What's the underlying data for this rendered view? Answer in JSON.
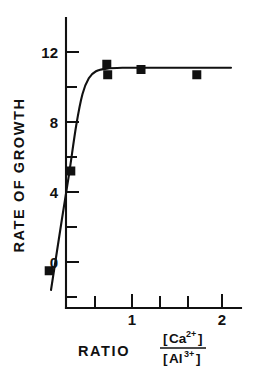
{
  "chart_data": {
    "type": "scatter",
    "title": "",
    "xlabel": "RATIO [Ca2+]/[Al3+]",
    "ylabel": "RATE OF GROWTH",
    "xlim": [
      0,
      2.2
    ],
    "ylim": [
      -2.5,
      13.5
    ],
    "grid": false,
    "legend": "none",
    "x_ticks": [
      0.5,
      1.0,
      1.5,
      2.0
    ],
    "x_tick_labels": [
      "",
      "1",
      "",
      "2"
    ],
    "x_minor_ticks": [
      0.75,
      1.25,
      1.75
    ],
    "y_ticks": [
      0,
      4,
      8,
      12
    ],
    "y_tick_labels": [
      "0",
      "4",
      "8",
      "12"
    ],
    "y_minor_ticks": [
      -2,
      2,
      6,
      10
    ],
    "points": [
      {
        "x": 0.08,
        "y": -0.5
      },
      {
        "x": 0.32,
        "y": 5.2
      },
      {
        "x": 0.72,
        "y": 11.3
      },
      {
        "x": 0.73,
        "y": 10.7
      },
      {
        "x": 1.1,
        "y": 11.0
      },
      {
        "x": 1.72,
        "y": 10.7
      }
    ],
    "curve_description": "sigmoidal saturation curve rising steeply from about 0 to a plateau of about 11",
    "curve": [
      {
        "x": 0.1,
        "y": -1.6
      },
      {
        "x": 0.22,
        "y": 2.4
      },
      {
        "x": 0.3,
        "y": 5.0
      },
      {
        "x": 0.38,
        "y": 7.8
      },
      {
        "x": 0.45,
        "y": 9.6
      },
      {
        "x": 0.52,
        "y": 10.5
      },
      {
        "x": 0.6,
        "y": 10.9
      },
      {
        "x": 0.72,
        "y": 11.05
      },
      {
        "x": 0.9,
        "y": 11.1
      },
      {
        "x": 1.1,
        "y": 11.1
      },
      {
        "x": 1.5,
        "y": 11.1
      },
      {
        "x": 2.0,
        "y": 11.1
      },
      {
        "x": 2.1,
        "y": 11.1
      }
    ]
  },
  "axes": {
    "y_axis_label": "RATE OF GROWTH",
    "y_tick_12": "12",
    "y_tick_8": "8",
    "y_tick_4": "4",
    "y_tick_0": "0",
    "x_tick_1": "1",
    "x_tick_2": "2"
  },
  "x_axis_caption": {
    "ratio_word": "RATIO",
    "numerator_bracket_open": "[",
    "numerator_element": "Ca",
    "numerator_charge": "2+",
    "numerator_bracket_close": "]",
    "denominator_bracket_open": "[",
    "denominator_element": "Al",
    "denominator_charge": "3+",
    "denominator_bracket_close": "]"
  },
  "style": {
    "ink_color": "#111111",
    "background_color": "#ffffff",
    "marker_color": "#111111"
  }
}
